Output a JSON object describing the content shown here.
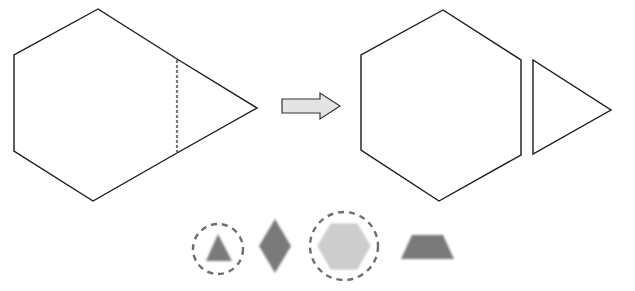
{
  "diagram": {
    "before": {
      "label": "combined-shape",
      "shape": "hexagon with attached triangle",
      "cut": "dashed vertical line"
    },
    "transform_arrow": "right-arrow",
    "after": {
      "pieces": [
        "hexagon",
        "triangle"
      ]
    },
    "pattern_blocks": {
      "items": [
        {
          "shape": "triangle",
          "highlighted": true,
          "shade": "dark"
        },
        {
          "shape": "rhombus",
          "highlighted": false,
          "shade": "dark"
        },
        {
          "shape": "hexagon",
          "highlighted": true,
          "shade": "light"
        },
        {
          "shape": "trapezoid",
          "highlighted": false,
          "shade": "dark"
        }
      ]
    },
    "colors": {
      "outline": "#1a1a1a",
      "dashed": "#777777",
      "arrow_fill": "#e4e4e4",
      "block_dark": "#7a7a7a",
      "block_light": "#cdcdcd"
    }
  }
}
